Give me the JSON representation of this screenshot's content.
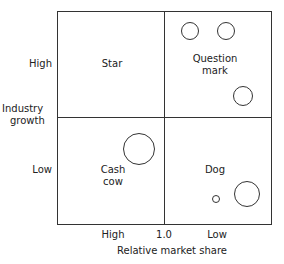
{
  "matrix": {
    "y_axis": {
      "label_line1": "Industry",
      "label_line2": "growth",
      "high": "High",
      "low": "Low"
    },
    "x_axis": {
      "label": "Relative market share",
      "high": "High",
      "mid": "1.0",
      "low": "Low"
    },
    "quadrants": {
      "top_left": {
        "label": "Star"
      },
      "top_right": {
        "label_line1": "Question",
        "label_line2": "mark"
      },
      "bottom_left": {
        "label_line1": "Cash",
        "label_line2": "cow"
      },
      "bottom_right": {
        "label": "Dog"
      }
    },
    "circles": [
      {
        "quadrant": "question-mark",
        "cx": 190,
        "cy": 31,
        "r": 9
      },
      {
        "quadrant": "question-mark",
        "cx": 226,
        "cy": 31,
        "r": 9
      },
      {
        "quadrant": "question-mark",
        "cx": 243,
        "cy": 96,
        "r": 10
      },
      {
        "quadrant": "cash-cow",
        "cx": 139,
        "cy": 149,
        "r": 16
      },
      {
        "quadrant": "dog",
        "cx": 216,
        "cy": 199,
        "r": 4
      },
      {
        "quadrant": "dog",
        "cx": 247,
        "cy": 194,
        "r": 13
      }
    ]
  }
}
